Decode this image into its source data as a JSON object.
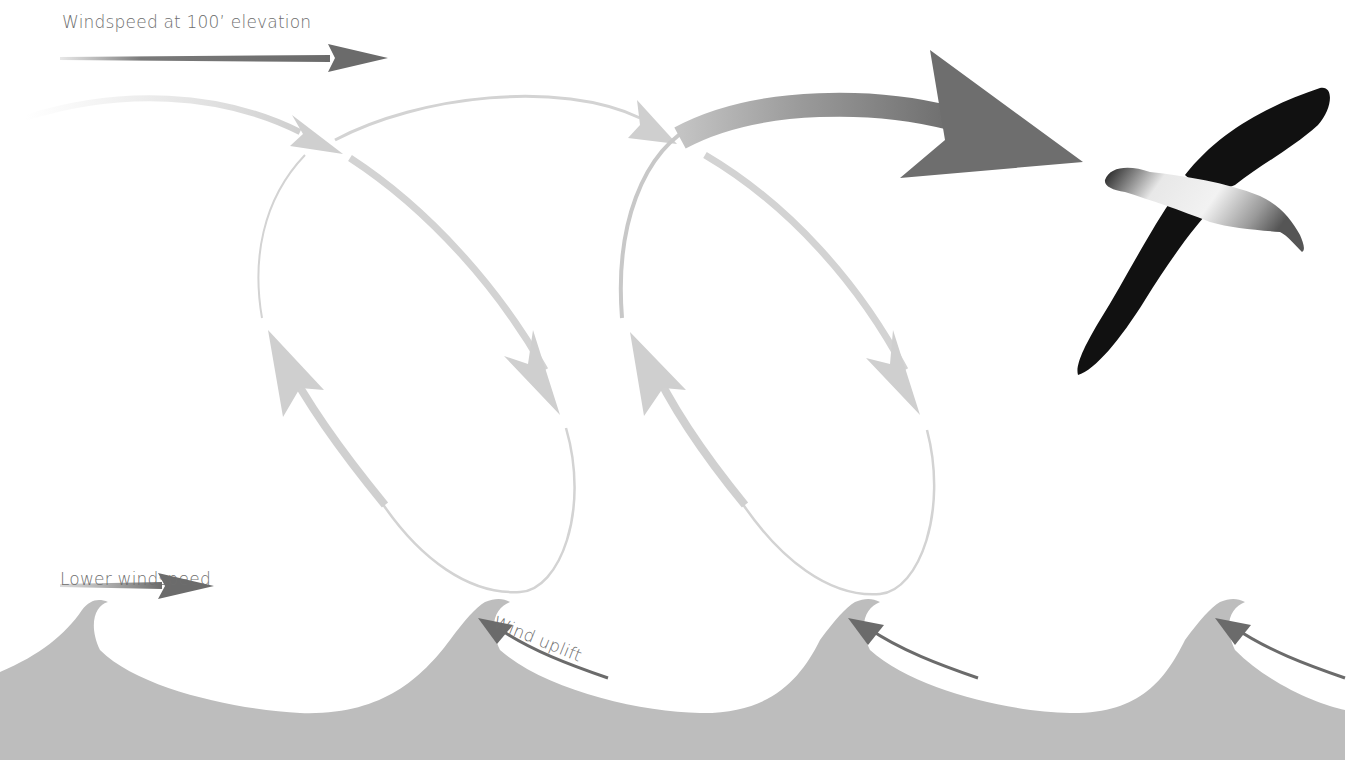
{
  "diagram": {
    "labels": {
      "upper_wind": "Windspeed at 100’ elevation",
      "lower_wind": "Lower windspeed",
      "uplift": "Wind uplift"
    },
    "elements": {
      "upper_wind_arrow": "strong wind arrow pointing right",
      "lower_wind_arrow": "short wind arrow pointing right",
      "flight_loops": 2,
      "uplift_arrows": 4,
      "waves": 4,
      "bird": "albatross in flight"
    },
    "colors": {
      "text": "#6e6e6e",
      "dark_arrow": "#6b6b6b",
      "light_arrow": "#cfcfcf",
      "mid_arrow": "#a8a8a8",
      "wave": "#bdbdbd",
      "bird_dark": "#111111",
      "bird_light": "#e6e6e6"
    }
  }
}
